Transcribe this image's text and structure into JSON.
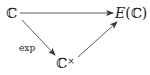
{
  "diagram": {
    "type": "commutative-diagram",
    "nodes": [
      {
        "id": "C",
        "label": "ℂ"
      },
      {
        "id": "EC",
        "label_italic": "E",
        "label_rest": "(ℂ)"
      },
      {
        "id": "Cx",
        "label": "ℂ",
        "superscript": "×"
      }
    ],
    "edges": [
      {
        "from": "C",
        "to": "EC",
        "label": ""
      },
      {
        "from": "C",
        "to": "Cx",
        "label": "exp"
      },
      {
        "from": "Cx",
        "to": "EC",
        "label": ""
      }
    ]
  }
}
